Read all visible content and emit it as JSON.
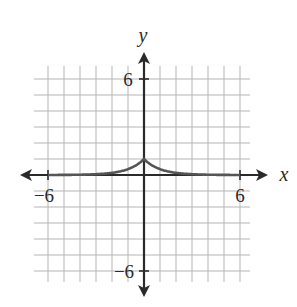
{
  "chart_data": {
    "type": "line",
    "title": "",
    "xlabel": "x",
    "ylabel": "y",
    "xlim": [
      -6.5,
      6.5
    ],
    "ylim": [
      -6.5,
      6.5
    ],
    "grid": true,
    "x_ticks_labeled": [
      -6,
      6
    ],
    "y_ticks_labeled": [
      6,
      -6
    ],
    "series": [
      {
        "name": "curve",
        "description": "cusp peak at (0,1), decays toward 0 on both sides (y = e^(-|x|))",
        "x": [
          -6,
          -5,
          -4,
          -3,
          -2,
          -1,
          -0.5,
          0,
          0.5,
          1,
          2,
          3,
          4,
          5,
          6
        ],
        "y": [
          0.0025,
          0.0067,
          0.018,
          0.05,
          0.135,
          0.368,
          0.607,
          1,
          0.607,
          0.368,
          0.135,
          0.05,
          0.018,
          0.0067,
          0.0025
        ]
      }
    ]
  },
  "labels": {
    "x_axis": "x",
    "y_axis": "y",
    "x_neg": "−6",
    "x_pos": "6",
    "y_pos": "6",
    "y_neg": "−6"
  },
  "colors": {
    "grid": "#b5b5b5",
    "axis": "#2a2a2a",
    "curve": "#555555"
  }
}
